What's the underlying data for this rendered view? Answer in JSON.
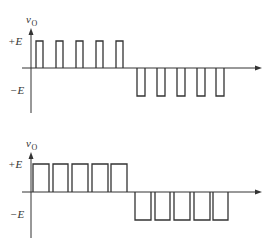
{
  "figure": {
    "panels": [
      {
        "id": "top",
        "y_axis_label": "v",
        "y_axis_subscript": "O",
        "levels": {
          "pos_label": "+E",
          "neg_label": "−E"
        },
        "geometry": {
          "axis_x": 31,
          "axis_top": 28,
          "axis_bottom": 113,
          "baseline_y": 68,
          "pos_y": 41,
          "neg_y": 96,
          "x_end": 262
        },
        "positive_pulses": [
          [
            36,
            43
          ],
          [
            56,
            63
          ],
          [
            76,
            83
          ],
          [
            96,
            103
          ],
          [
            116,
            123
          ]
        ],
        "negative_pulses": [
          [
            137,
            145
          ],
          [
            157,
            165
          ],
          [
            177,
            185
          ],
          [
            197,
            205
          ],
          [
            216,
            224
          ]
        ],
        "description": "Narrow pulses (low duty cycle)"
      },
      {
        "id": "bottom",
        "y_axis_label": "v",
        "y_axis_subscript": "O",
        "levels": {
          "pos_label": "+E",
          "neg_label": "−E"
        },
        "geometry": {
          "axis_x": 31,
          "axis_top": 152,
          "axis_bottom": 238,
          "baseline_y": 192,
          "pos_y": 164,
          "neg_y": 220,
          "x_end": 262
        },
        "positive_pulses": [
          [
            33,
            49
          ],
          [
            53,
            68
          ],
          [
            72,
            88
          ],
          [
            92,
            108
          ],
          [
            111,
            127
          ]
        ],
        "negative_pulses": [
          [
            135,
            151
          ],
          [
            155,
            170
          ],
          [
            174,
            190
          ],
          [
            194,
            210
          ],
          [
            213,
            228
          ]
        ],
        "description": "Wide pulses (high duty cycle)"
      }
    ]
  }
}
